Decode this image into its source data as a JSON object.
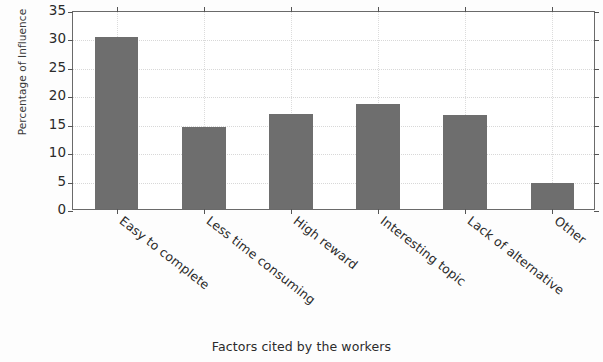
{
  "chart_data": {
    "type": "bar",
    "title": "",
    "categories": [
      "Easy to complete",
      "Less time consuming",
      "High reward",
      "Interesting topic",
      "Lack of alternative",
      "Other"
    ],
    "values": [
      30.2,
      14.4,
      16.7,
      18.4,
      16.5,
      4.6
    ],
    "xlabel": "Factors cited by the workers",
    "ylabel": "Percentage of Influence",
    "ylim": [
      0,
      35
    ],
    "yticks": [
      0,
      5,
      10,
      15,
      20,
      25,
      30,
      35
    ],
    "ytick_labels": [
      "0",
      "5",
      "10",
      "15",
      "20",
      "25",
      "30",
      "35"
    ],
    "grid": true,
    "legend": "none",
    "bar_color": "#6e6e6e",
    "background_color": "#ffffff",
    "axis_color": "#6a6a6a",
    "gridline_color": "#d8d8d8",
    "xtick_rotation_degrees": -38
  }
}
